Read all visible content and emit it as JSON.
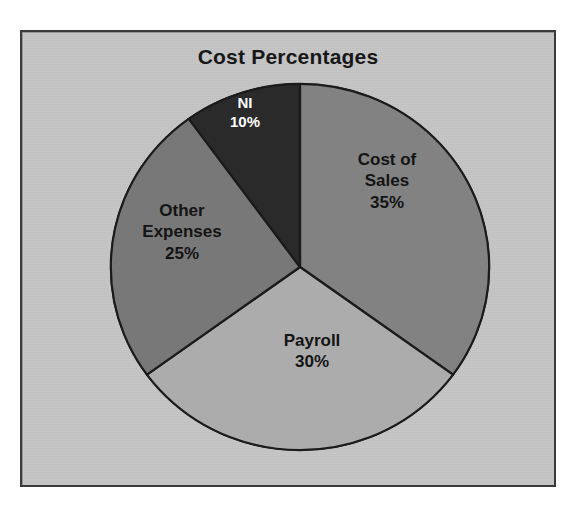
{
  "panel": {
    "background_color": "#c6c6c6",
    "border_color": "#3a3a3a"
  },
  "chart_data": {
    "type": "pie",
    "title": "Cost Percentages",
    "xlabel": "",
    "ylabel": "",
    "legend": "none",
    "grid": false,
    "start_angle_deg": 0,
    "direction": "clockwise",
    "categories": [
      "Cost of Sales",
      "Payroll",
      "Other Expenses",
      "NI"
    ],
    "values": [
      35,
      30,
      25,
      10
    ],
    "value_unit": "%",
    "colors": [
      "#828282",
      "#acacac",
      "#787878",
      "#2a2a2a"
    ],
    "slices": [
      {
        "name": "Cost of Sales",
        "value": 35,
        "value_text": "35%",
        "label_lines": [
          "Cost of",
          "Sales",
          "35%"
        ],
        "color": "#828282",
        "label_color": "#141414",
        "start_angle_deg": 0,
        "end_angle_deg": 126
      },
      {
        "name": "Payroll",
        "value": 30,
        "value_text": "30%",
        "label_lines": [
          "Payroll",
          "30%"
        ],
        "color": "#acacac",
        "label_color": "#141414",
        "start_angle_deg": 126,
        "end_angle_deg": 234
      },
      {
        "name": "Other Expenses",
        "value": 25,
        "value_text": "25%",
        "label_lines": [
          "Other",
          "Expenses",
          "25%"
        ],
        "color": "#787878",
        "label_color": "#141414",
        "start_angle_deg": 234,
        "end_angle_deg": 324
      },
      {
        "name": "NI",
        "value": 10,
        "value_text": "10%",
        "label_lines": [
          "NI",
          "10%"
        ],
        "color": "#2a2a2a",
        "label_color": "#ffffff",
        "start_angle_deg": 324,
        "end_angle_deg": 360
      }
    ]
  },
  "labels": {
    "cost_of_sales": {
      "line1": "Cost of",
      "line2": "Sales",
      "line3": "35%"
    },
    "payroll": {
      "line1": "Payroll",
      "line2": "30%"
    },
    "other_expenses": {
      "line1": "Other",
      "line2": "Expenses",
      "line3": "25%"
    },
    "ni": {
      "line1": "NI",
      "line2": "10%"
    }
  }
}
